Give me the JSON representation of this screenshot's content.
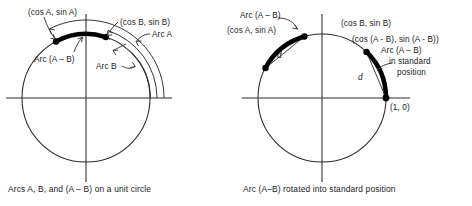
{
  "figure": {
    "type": "math-diagram",
    "panels": [
      {
        "id": "left",
        "caption": "Arcs A, B, and (A – B) on a unit circle",
        "circle": {
          "cx": 86,
          "cy": 98,
          "r": 64,
          "label": "unit circle"
        },
        "axes": {
          "x_from": 6,
          "x_to": 172,
          "y_from": 14,
          "y_to": 182
        },
        "points": [
          {
            "name": "point-cos-a-sin-a",
            "label": "(cos A, sin A)",
            "angle_deg": 118
          },
          {
            "name": "point-cos-b-sin-b",
            "label": "(cos B, sin B)",
            "angle_deg": 72
          }
        ],
        "arcs": [
          {
            "name": "arc-a-minus-b",
            "label": "Arc (A – B)",
            "from_deg": 72,
            "to_deg": 118,
            "style": "thick"
          },
          {
            "name": "arc-a",
            "label": "Arc A",
            "from_deg": 0,
            "to_deg": 118,
            "style": "thin-offset",
            "offset": 14
          },
          {
            "name": "arc-b",
            "label": "Arc B",
            "from_deg": 0,
            "to_deg": 72,
            "style": "thin-offset",
            "offset": 7
          }
        ],
        "labels": [
          {
            "name": "label-cos-a-sin-a",
            "text": "(cos A, sin A)"
          },
          {
            "name": "label-cos-b-sin-b",
            "text": "(cos B, sin B)"
          },
          {
            "name": "label-arc-a",
            "text": "Arc A"
          },
          {
            "name": "label-arc-b",
            "text": "Arc B"
          },
          {
            "name": "label-arc-a-minus-b",
            "text": "Arc (A – B)"
          }
        ]
      },
      {
        "id": "right",
        "caption": "Arc (A–B) rotated into standard position",
        "circle": {
          "cx": 322,
          "cy": 98,
          "r": 64,
          "label": "unit circle"
        },
        "axes": {
          "x_from": 242,
          "x_to": 410,
          "y_from": 14,
          "y_to": 182
        },
        "points": [
          {
            "name": "point-cos-a-sin-a",
            "label": "(cos A, sin A)",
            "angle_deg": 152
          },
          {
            "name": "point-cos-b-sin-b",
            "label": "(cos B, sin B)",
            "angle_deg": 106
          },
          {
            "name": "point-cos-amb-sin-amb",
            "label": "(cos (A - B), sin (A - B))",
            "angle_deg": 46
          },
          {
            "name": "point-one-zero",
            "label": "(1, 0)",
            "angle_deg": 0
          }
        ],
        "arcs": [
          {
            "name": "arc-a-minus-b-upper",
            "label": "Arc (A – B)",
            "from_deg": 106,
            "to_deg": 152,
            "style": "thick"
          },
          {
            "name": "arc-a-minus-b-standard",
            "label": "Arc (A – B) in standard position",
            "from_deg": 0,
            "to_deg": 46,
            "style": "thick"
          }
        ],
        "chords": [
          {
            "name": "chord-upper",
            "label": "d"
          },
          {
            "name": "chord-standard",
            "label": "d"
          }
        ],
        "labels": [
          {
            "name": "label-arc-a-minus-b",
            "text": "Arc (A – B)"
          },
          {
            "name": "label-cos-a-sin-a",
            "text": "(cos A, sin A)"
          },
          {
            "name": "label-cos-b-sin-b",
            "text": "(cos B, sin B)"
          },
          {
            "name": "label-cos-amb",
            "text": "(cos (A - B), sin (A - B))"
          },
          {
            "name": "label-standard-1",
            "text": "Arc (A – B)"
          },
          {
            "name": "label-standard-2",
            "text": "in standard"
          },
          {
            "name": "label-standard-3",
            "text": "position"
          },
          {
            "name": "label-one-zero",
            "text": "(1, 0)"
          },
          {
            "name": "label-d-upper",
            "text": "d"
          },
          {
            "name": "label-d-standard",
            "text": "d"
          }
        ]
      }
    ]
  }
}
